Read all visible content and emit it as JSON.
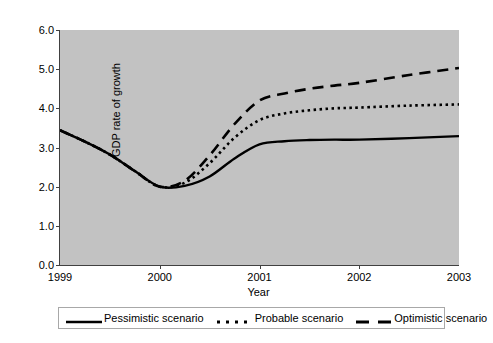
{
  "chart_data": {
    "type": "line",
    "title": "",
    "xlabel": "Year",
    "ylabel": "GDP rate of growth",
    "x": [
      1999,
      2000,
      2001,
      2002,
      2003
    ],
    "categories": [
      "1999",
      "2000",
      "2001",
      "2002",
      "2003"
    ],
    "xlim": [
      1999,
      2003
    ],
    "ylim": [
      0.0,
      6.0
    ],
    "y_ticks": [
      "0.0",
      "1.0",
      "2.0",
      "3.0",
      "4.0",
      "5.0",
      "6.0"
    ],
    "y_tick_values": [
      0.0,
      1.0,
      2.0,
      3.0,
      4.0,
      5.0,
      6.0
    ],
    "x_ticks": [
      "1999",
      "2000",
      "2001",
      "2002",
      "2003"
    ],
    "grid": false,
    "legend_position": "bottom",
    "plot_background": "#c2c2c2",
    "line_color": "#000000",
    "series": [
      {
        "name": "Pessimistic scenario",
        "style": "solid",
        "values": [
          3.44,
          2.0,
          3.08,
          3.2,
          3.29
        ],
        "points": [
          [
            1999.0,
            3.44
          ],
          [
            1999.25,
            3.15
          ],
          [
            1999.5,
            2.82
          ],
          [
            1999.75,
            2.4
          ],
          [
            2000.0,
            2.0
          ],
          [
            2000.25,
            2.02
          ],
          [
            2000.5,
            2.26
          ],
          [
            2000.75,
            2.72
          ],
          [
            2001.0,
            3.08
          ],
          [
            2001.25,
            3.16
          ],
          [
            2001.5,
            3.19
          ],
          [
            2001.75,
            3.2
          ],
          [
            2002.0,
            3.2
          ],
          [
            2002.5,
            3.24
          ],
          [
            2003.0,
            3.29
          ]
        ]
      },
      {
        "name": "Probable scenario",
        "style": "dotted",
        "values": [
          3.44,
          2.0,
          3.7,
          4.02,
          4.1
        ],
        "points": [
          [
            1999.0,
            3.44
          ],
          [
            1999.25,
            3.15
          ],
          [
            1999.5,
            2.82
          ],
          [
            1999.75,
            2.4
          ],
          [
            2000.0,
            2.0
          ],
          [
            2000.25,
            2.1
          ],
          [
            2000.5,
            2.6
          ],
          [
            2000.75,
            3.25
          ],
          [
            2001.0,
            3.7
          ],
          [
            2001.25,
            3.87
          ],
          [
            2001.5,
            3.95
          ],
          [
            2001.75,
            4.0
          ],
          [
            2002.0,
            4.02
          ],
          [
            2002.5,
            4.07
          ],
          [
            2003.0,
            4.1
          ]
        ]
      },
      {
        "name": "Optimistic scenario",
        "style": "dashed",
        "values": [
          3.44,
          2.0,
          4.2,
          4.65,
          5.03
        ],
        "points": [
          [
            1999.0,
            3.44
          ],
          [
            1999.25,
            3.15
          ],
          [
            1999.5,
            2.82
          ],
          [
            1999.75,
            2.4
          ],
          [
            2000.0,
            2.0
          ],
          [
            2000.25,
            2.15
          ],
          [
            2000.5,
            2.8
          ],
          [
            2000.75,
            3.6
          ],
          [
            2001.0,
            4.2
          ],
          [
            2001.25,
            4.38
          ],
          [
            2001.5,
            4.5
          ],
          [
            2001.75,
            4.58
          ],
          [
            2002.0,
            4.65
          ],
          [
            2002.5,
            4.85
          ],
          [
            2003.0,
            5.03
          ]
        ]
      }
    ]
  },
  "legend": {
    "entries": [
      {
        "label": "Pessimistic scenario",
        "style": "solid"
      },
      {
        "label": "Probable scenario",
        "style": "dotted"
      },
      {
        "label": "Optimistic scenario",
        "style": "dashed"
      }
    ]
  }
}
